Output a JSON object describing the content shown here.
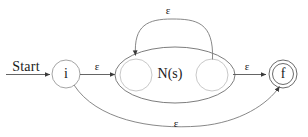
{
  "diagram": {
    "kind": "nfa-thompson-construction",
    "title_text": "",
    "states": {
      "start_label": "Start",
      "initial": {
        "name": "i",
        "label": "i",
        "shape": "circle",
        "accepting": false,
        "cx": 66,
        "cy": 74,
        "r": 14
      },
      "final": {
        "name": "f",
        "label": "f",
        "shape": "double-circle",
        "accepting": true,
        "cx": 283,
        "cy": 74,
        "r_outer": 14,
        "r_inner": 11
      },
      "sub_nfa": {
        "label": "N(s)",
        "cx": 175,
        "cy": 75,
        "rx": 60,
        "ry": 28,
        "inner_start": {
          "cx": 136,
          "cy": 75,
          "r": 16
        },
        "inner_end": {
          "cx": 212,
          "cy": 75,
          "r": 16
        }
      }
    },
    "transitions": [
      {
        "name": "start-to-i",
        "label": "",
        "from": "start-arrow",
        "to": "i",
        "kind": "straight"
      },
      {
        "name": "i-to-sub",
        "label": "ε",
        "from": "i",
        "to": "N(s)",
        "kind": "straight",
        "label_x": 97,
        "label_y": 66
      },
      {
        "name": "sub-to-f",
        "label": "ε",
        "from": "N(s)",
        "to": "f",
        "kind": "straight",
        "label_x": 247,
        "label_y": 66
      },
      {
        "name": "loop-back",
        "label": "ε",
        "from": "N(s)-end",
        "to": "N(s)-start",
        "kind": "arc-top",
        "label_x": 168,
        "label_y": 9
      },
      {
        "name": "bypass",
        "label": "ε",
        "from": "i",
        "to": "f",
        "kind": "arc-bottom",
        "label_x": 176,
        "label_y": 121
      }
    ],
    "colors": {
      "stroke": "#4a4a4a",
      "text": "#1a1a1a",
      "background": "#ffffff"
    }
  }
}
